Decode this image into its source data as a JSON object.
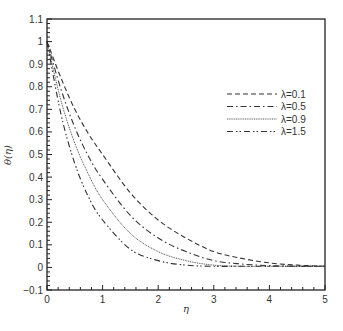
{
  "chart_data": {
    "type": "line",
    "title": "",
    "xlabel": "η",
    "ylabel": "θ(η)",
    "xlim": [
      0,
      5
    ],
    "ylim": [
      -0.1,
      1.1
    ],
    "xticks": [
      0,
      1,
      2,
      3,
      4,
      5
    ],
    "yticks": [
      -0.1,
      0,
      0.1,
      0.2,
      0.3,
      0.4,
      0.5,
      0.6,
      0.7,
      0.8,
      0.9,
      1,
      1.1
    ],
    "ytick_labels": [
      "−0.1",
      "0",
      "0.1",
      "0.2",
      "0.3",
      "0.4",
      "0.5",
      "0.6",
      "0.7",
      "0.8",
      "0.9",
      "1",
      "1.1"
    ],
    "grid": false,
    "legend_position": "upper right (inside)",
    "x": [
      0,
      0.25,
      0.5,
      0.75,
      1,
      1.5,
      2,
      2.5,
      3,
      3.5,
      4,
      4.5,
      5
    ],
    "series": [
      {
        "name": "λ=0.1",
        "style": "dashed",
        "values": [
          1.0,
          0.84,
          0.7,
          0.59,
          0.5,
          0.33,
          0.21,
          0.13,
          0.07,
          0.04,
          0.02,
          0.01,
          0.005
        ]
      },
      {
        "name": "λ=0.5",
        "style": "dashdot",
        "values": [
          1.0,
          0.79,
          0.62,
          0.49,
          0.39,
          0.23,
          0.13,
          0.07,
          0.03,
          0.015,
          0.008,
          0.005,
          0.005
        ]
      },
      {
        "name": "λ=0.9",
        "style": "dotted",
        "values": [
          1.0,
          0.74,
          0.55,
          0.41,
          0.3,
          0.15,
          0.07,
          0.03,
          0.01,
          0.005,
          0.005,
          0.005,
          0.005
        ]
      },
      {
        "name": "λ=1.5",
        "style": "dashdotdot",
        "values": [
          1.0,
          0.68,
          0.46,
          0.31,
          0.21,
          0.08,
          0.03,
          0.01,
          0.005,
          0.005,
          0.005,
          0.005,
          0.005
        ]
      }
    ]
  },
  "legend": {
    "items": [
      {
        "label": "λ=0.1"
      },
      {
        "label": "λ=0.5"
      },
      {
        "label": "λ=0.9"
      },
      {
        "label": "λ=1.5"
      }
    ]
  },
  "axes": {
    "xlabel": "η",
    "ylabel": "θ(η)",
    "xtick_labels": [
      "0",
      "1",
      "2",
      "3",
      "4",
      "5"
    ],
    "ytick_labels": [
      "−0.1",
      "0",
      "0.1",
      "0.2",
      "0.3",
      "0.4",
      "0.5",
      "0.6",
      "0.7",
      "0.8",
      "0.9",
      "1",
      "1.1"
    ]
  }
}
